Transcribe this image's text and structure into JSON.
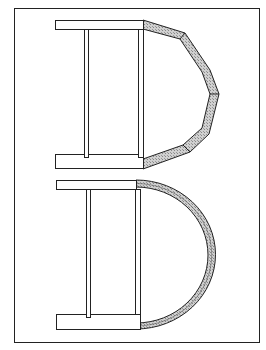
{
  "diagram": {
    "type": "architectural plan",
    "panels": [
      {
        "name": "top",
        "apse": "polygonal",
        "segments": 4
      },
      {
        "name": "bottom",
        "apse": "semicircular",
        "segments": 1
      }
    ],
    "colors": {
      "stroke": "#222222",
      "fill": "#ffffff",
      "hatch": "#b8b8b8",
      "background": "#ffffff"
    }
  }
}
